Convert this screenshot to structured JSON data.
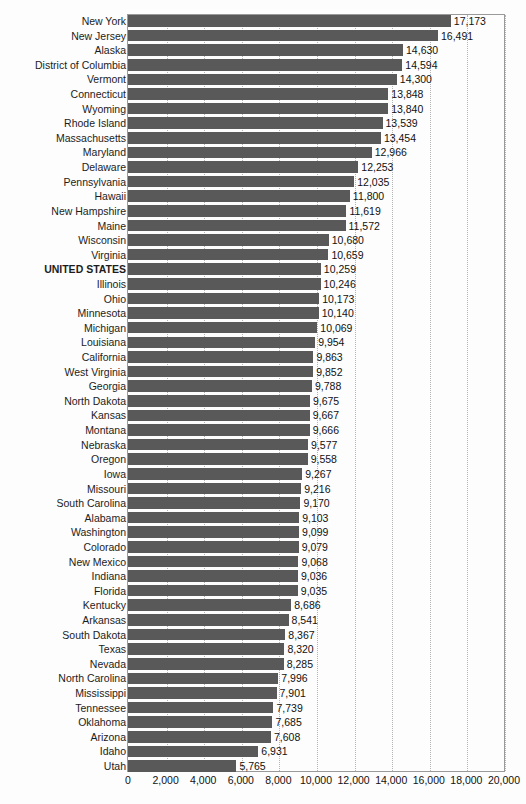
{
  "chart_data": {
    "type": "bar",
    "orientation": "horizontal",
    "title": "",
    "subtitle": "",
    "xlabel": "",
    "ylabel": "",
    "xlim": [
      0,
      20000
    ],
    "grid": true,
    "grid_axis": "x",
    "legend": false,
    "bar_color": "#595959",
    "background_color": "#fdfdfd",
    "axis_border_color": "#9a9a9a",
    "gridline_color": "#b4b4b4",
    "highlight_category": "UNITED STATES",
    "xticks": [
      0,
      2000,
      4000,
      6000,
      8000,
      10000,
      12000,
      14000,
      16000,
      18000,
      20000
    ],
    "xtick_labels": [
      "0",
      "2,000",
      "4,000",
      "6,000",
      "8,000",
      "10,000",
      "12,000",
      "14,000",
      "16,000",
      "18,000",
      "20,000"
    ],
    "categories": [
      "New York",
      "New Jersey",
      "Alaska",
      "District of Columbia",
      "Vermont",
      "Connecticut",
      "Wyoming",
      "Rhode Island",
      "Massachusetts",
      "Maryland",
      "Delaware",
      "Pennsylvania",
      "Hawaii",
      "New Hampshire",
      "Maine",
      "Wisconsin",
      "Virginia",
      "UNITED STATES",
      "Illinois",
      "Ohio",
      "Minnesota",
      "Michigan",
      "Louisiana",
      "California",
      "West Virginia",
      "Georgia",
      "North Dakota",
      "Kansas",
      "Montana",
      "Nebraska",
      "Oregon",
      "Iowa",
      "Missouri",
      "South Carolina",
      "Alabama",
      "Washington",
      "Colorado",
      "New Mexico",
      "Indiana",
      "Florida",
      "Kentucky",
      "Arkansas",
      "South Dakota",
      "Texas",
      "Nevada",
      "North Carolina",
      "Mississippi",
      "Tennessee",
      "Oklahoma",
      "Arizona",
      "Idaho",
      "Utah"
    ],
    "values": [
      17173,
      16491,
      14630,
      14594,
      14300,
      13848,
      13840,
      13539,
      13454,
      12966,
      12253,
      12035,
      11800,
      11619,
      11572,
      10680,
      10659,
      10259,
      10246,
      10173,
      10140,
      10069,
      9954,
      9863,
      9852,
      9788,
      9675,
      9667,
      9666,
      9577,
      9558,
      9267,
      9216,
      9170,
      9103,
      9099,
      9079,
      9068,
      9036,
      9035,
      8686,
      8541,
      8367,
      8320,
      8285,
      7996,
      7901,
      7739,
      7685,
      7608,
      6931,
      5765
    ],
    "value_labels": [
      "17,173",
      "16,491",
      "14,630",
      "14,594",
      "14,300",
      "13,848",
      "13,840",
      "13,539",
      "13,454",
      "12,966",
      "12,253",
      "12,035",
      "11,800",
      "11,619",
      "11,572",
      "10,680",
      "10,659",
      "10,259",
      "10,246",
      "10,173",
      "10,140",
      "10,069",
      "9,954",
      "9,863",
      "9,852",
      "9,788",
      "9,675",
      "9,667",
      "9,666",
      "9,577",
      "9,558",
      "9,267",
      "9,216",
      "9,170",
      "9,103",
      "9,099",
      "9,079",
      "9,068",
      "9,036",
      "9,035",
      "8,686",
      "8,541",
      "8,367",
      "8,320",
      "8,285",
      "7,996",
      "7,901",
      "7,739",
      "7,685",
      "7,608",
      "6,931",
      "5,765"
    ]
  }
}
